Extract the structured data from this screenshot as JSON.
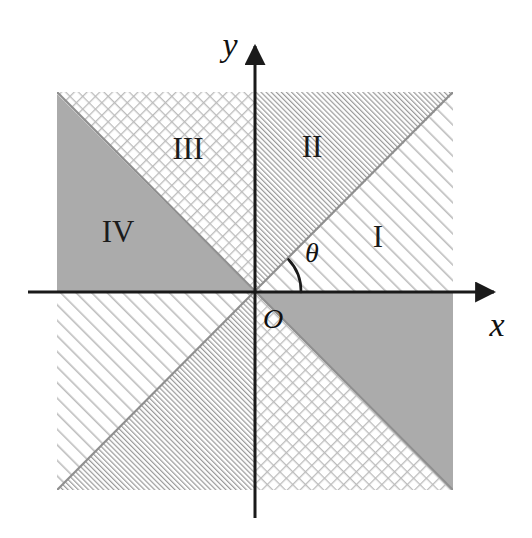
{
  "figure": {
    "background_color": "#ffffff"
  },
  "axes": {
    "x_label": "x",
    "y_label": "y",
    "origin_label": "O",
    "axis_color": "#1a1a1a",
    "x_axis": {
      "start_x": 28,
      "end_x": 498,
      "y": 292,
      "arrow": "right"
    },
    "y_axis": {
      "x": 255,
      "start_y": 518,
      "end_y": 40,
      "arrow": "up"
    }
  },
  "angle": {
    "label": "θ",
    "vertex_x": 255,
    "vertex_y": 292,
    "start_deg": 0,
    "end_deg": 45,
    "arc_radius": 46
  },
  "plot_area": {
    "left": 57,
    "top": 92,
    "right": 453,
    "bottom": 490,
    "center_x": 255,
    "center_y": 292
  },
  "colors": {
    "solid_gray": "#ababab",
    "dense_hatch_line": "#9a9a9a",
    "sparse_hatch_line": "#b4b4b4",
    "cross_hatch_line": "#b8b8b8",
    "ink": "#1a1a1a"
  },
  "regions": [
    {
      "id": "region-1",
      "label": "I",
      "pattern": "sparse-diagonal-hatch",
      "label_x": 378,
      "label_y": 240,
      "angle_range_deg": [
        0,
        45
      ],
      "description": "Right of y-axis, below the main 45 degree diagonal, above the x-axis"
    },
    {
      "id": "region-2",
      "label": "II",
      "pattern": "dense-diagonal-hatch",
      "label_x": 312,
      "label_y": 150,
      "angle_range_deg": [
        45,
        90
      ],
      "description": "Right of y-axis, above the main 45 degree diagonal"
    },
    {
      "id": "region-3",
      "label": "III",
      "pattern": "cross-hatch",
      "label_x": 188,
      "label_y": 152,
      "angle_range_deg": [
        90,
        135
      ],
      "description": "Left of y-axis, above the anti-diagonal"
    },
    {
      "id": "region-4",
      "label": "IV",
      "pattern": "solid-gray",
      "label_x": 118,
      "label_y": 235,
      "angle_range_deg": [
        135,
        180
      ],
      "description": "Left of y-axis, below the anti-diagonal, above the x-axis"
    },
    {
      "id": "region-1-opposite",
      "label": "",
      "pattern": "sparse-diagonal-hatch",
      "angle_range_deg": [
        180,
        225
      ],
      "description": "Octant opposite region I"
    },
    {
      "id": "region-2-opposite",
      "label": "",
      "pattern": "dense-diagonal-hatch",
      "angle_range_deg": [
        225,
        270
      ],
      "description": "Octant opposite region II"
    },
    {
      "id": "region-3-opposite",
      "label": "",
      "pattern": "cross-hatch",
      "angle_range_deg": [
        270,
        315
      ],
      "description": "Octant opposite region III"
    },
    {
      "id": "region-4-opposite",
      "label": "",
      "pattern": "solid-gray",
      "angle_range_deg": [
        315,
        360
      ],
      "description": "Octant opposite region IV"
    }
  ]
}
